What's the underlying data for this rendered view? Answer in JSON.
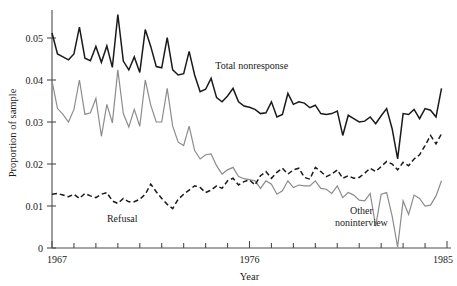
{
  "chart_data": {
    "type": "line",
    "title": "",
    "xlabel": "Year",
    "ylabel": "Proportion of sample",
    "xlim": [
      1967,
      1985
    ],
    "ylim": [
      0,
      0.055
    ],
    "grid": false,
    "legend_position": "inline-annotations",
    "y_ticks": [
      "0",
      "0.01",
      "0.02",
      "0.03",
      "0.04",
      "0.05"
    ],
    "y_tick_values": [
      0,
      0.01,
      0.02,
      0.03,
      0.04,
      0.05
    ],
    "x_ticks": [
      "1967",
      "1976",
      "1985"
    ],
    "x_tick_values": [
      1967,
      1976,
      1985
    ],
    "x_minor_tick_interval": 1,
    "colors": {
      "total_nonresponse": "#1a1a1a",
      "refusal": "#1a1a1a",
      "other_noninterview": "#8c8c8c",
      "axis": "#4d4d4d"
    },
    "series": [
      {
        "name": "Total nonresponse",
        "label": "Total nonresponse",
        "style": "solid",
        "color": "#1a1a1a",
        "width": 1.5,
        "label_x": 1976.1,
        "label_y": 0.0427,
        "x": [
          1967.0,
          1967.25,
          1967.5,
          1967.75,
          1968.0,
          1968.25,
          1968.5,
          1968.75,
          1969.0,
          1969.25,
          1969.5,
          1969.75,
          1970.0,
          1970.25,
          1970.5,
          1970.75,
          1971.0,
          1971.25,
          1971.5,
          1971.75,
          1972.0,
          1972.25,
          1972.5,
          1972.75,
          1973.0,
          1973.25,
          1973.5,
          1973.75,
          1974.0,
          1974.25,
          1974.5,
          1974.75,
          1975.0,
          1975.25,
          1975.5,
          1975.75,
          1976.0,
          1976.25,
          1976.5,
          1976.75,
          1977.0,
          1977.25,
          1977.5,
          1977.75,
          1978.0,
          1978.25,
          1978.5,
          1978.75,
          1979.0,
          1979.25,
          1979.5,
          1979.75,
          1980.0,
          1980.25,
          1980.5,
          1980.75,
          1981.0,
          1981.25,
          1981.5,
          1981.75,
          1982.0,
          1982.25,
          1982.5,
          1982.75,
          1983.0,
          1983.25,
          1983.5,
          1983.75,
          1984.0,
          1984.25,
          1984.5,
          1984.75
        ],
        "y": [
          0.0512,
          0.0462,
          0.0455,
          0.0448,
          0.0462,
          0.0526,
          0.0452,
          0.0446,
          0.048,
          0.0442,
          0.0481,
          0.043,
          0.0556,
          0.0445,
          0.0424,
          0.0455,
          0.0418,
          0.052,
          0.048,
          0.0432,
          0.0429,
          0.0501,
          0.0424,
          0.0412,
          0.0415,
          0.0468,
          0.0412,
          0.0372,
          0.0378,
          0.0404,
          0.0358,
          0.0348,
          0.0362,
          0.038,
          0.0348,
          0.0338,
          0.0335,
          0.033,
          0.032,
          0.0322,
          0.0348,
          0.0312,
          0.0318,
          0.0368,
          0.0342,
          0.0348,
          0.0345,
          0.0334,
          0.034,
          0.032,
          0.0318,
          0.032,
          0.0326,
          0.0268,
          0.0316,
          0.0308,
          0.03,
          0.0302,
          0.0312,
          0.0296,
          0.0315,
          0.0332,
          0.0284,
          0.0212,
          0.032,
          0.0318,
          0.033,
          0.0308,
          0.0332,
          0.0328,
          0.0312,
          0.038
        ]
      },
      {
        "name": "Other noninterview",
        "label": "Other\nnoninterview",
        "label_line1": "Other",
        "label_line2": "noninterview",
        "style": "solid",
        "color": "#8c8c8c",
        "width": 1.2,
        "label_x": 1981.1,
        "label_y": 0.0082,
        "x": [
          1967.0,
          1967.25,
          1967.5,
          1967.75,
          1968.0,
          1968.25,
          1968.5,
          1968.75,
          1969.0,
          1969.25,
          1969.5,
          1969.75,
          1970.0,
          1970.25,
          1970.5,
          1970.75,
          1971.0,
          1971.25,
          1971.5,
          1971.75,
          1972.0,
          1972.25,
          1972.5,
          1972.75,
          1973.0,
          1973.25,
          1973.5,
          1973.75,
          1974.0,
          1974.25,
          1974.5,
          1974.75,
          1975.0,
          1975.25,
          1975.5,
          1975.75,
          1976.0,
          1976.25,
          1976.5,
          1976.75,
          1977.0,
          1977.25,
          1977.5,
          1977.75,
          1978.0,
          1978.25,
          1978.5,
          1978.75,
          1979.0,
          1979.25,
          1979.5,
          1979.75,
          1980.0,
          1980.25,
          1980.5,
          1980.75,
          1981.0,
          1981.25,
          1981.5,
          1981.75,
          1982.0,
          1982.25,
          1982.5,
          1982.75,
          1983.0,
          1983.25,
          1983.5,
          1983.75,
          1984.0,
          1984.25,
          1984.5,
          1984.75
        ],
        "y": [
          0.0398,
          0.0332,
          0.0318,
          0.03,
          0.033,
          0.04,
          0.0318,
          0.0322,
          0.0356,
          0.0266,
          0.0342,
          0.0298,
          0.0424,
          0.032,
          0.0288,
          0.033,
          0.029,
          0.04,
          0.034,
          0.03,
          0.03,
          0.038,
          0.029,
          0.0252,
          0.0244,
          0.029,
          0.0232,
          0.0212,
          0.0222,
          0.0224,
          0.0196,
          0.0176,
          0.0186,
          0.0192,
          0.017,
          0.0165,
          0.0163,
          0.016,
          0.0142,
          0.016,
          0.0152,
          0.0128,
          0.0136,
          0.016,
          0.0144,
          0.015,
          0.0148,
          0.0148,
          0.016,
          0.0142,
          0.014,
          0.013,
          0.0148,
          0.012,
          0.0132,
          0.0126,
          0.0114,
          0.0112,
          0.013,
          0.0052,
          0.0128,
          0.0132,
          0.0076,
          0.0002,
          0.0112,
          0.008,
          0.0126,
          0.0118,
          0.01,
          0.0102,
          0.0124,
          0.016
        ]
      },
      {
        "name": "Refusal",
        "label": "Refusal",
        "style": "dashed",
        "color": "#1a1a1a",
        "width": 1.5,
        "dash": "5,3",
        "label_x": 1970.2,
        "label_y": 0.0062,
        "x": [
          1967.0,
          1967.25,
          1967.5,
          1967.75,
          1968.0,
          1968.25,
          1968.5,
          1968.75,
          1969.0,
          1969.25,
          1969.5,
          1969.75,
          1970.0,
          1970.25,
          1970.5,
          1970.75,
          1971.0,
          1971.25,
          1971.5,
          1971.75,
          1972.0,
          1972.25,
          1972.5,
          1972.75,
          1973.0,
          1973.25,
          1973.5,
          1973.75,
          1974.0,
          1974.25,
          1974.5,
          1974.75,
          1975.0,
          1975.25,
          1975.5,
          1975.75,
          1976.0,
          1976.25,
          1976.5,
          1976.75,
          1977.0,
          1977.25,
          1977.5,
          1977.75,
          1978.0,
          1978.25,
          1978.5,
          1978.75,
          1979.0,
          1979.25,
          1979.5,
          1979.75,
          1980.0,
          1980.25,
          1980.5,
          1980.75,
          1981.0,
          1981.25,
          1981.5,
          1981.75,
          1982.0,
          1982.25,
          1982.5,
          1982.75,
          1983.0,
          1983.25,
          1983.5,
          1983.75,
          1984.0,
          1984.25,
          1984.5,
          1984.75
        ],
        "y": [
          0.0128,
          0.013,
          0.0126,
          0.0122,
          0.0128,
          0.0118,
          0.013,
          0.0124,
          0.012,
          0.0128,
          0.0132,
          0.0112,
          0.0106,
          0.0118,
          0.011,
          0.011,
          0.0116,
          0.0128,
          0.0152,
          0.0134,
          0.0118,
          0.0104,
          0.0094,
          0.0116,
          0.0128,
          0.0138,
          0.0148,
          0.0144,
          0.0132,
          0.0138,
          0.0148,
          0.0142,
          0.016,
          0.0166,
          0.015,
          0.0158,
          0.0162,
          0.015,
          0.0172,
          0.0182,
          0.0166,
          0.018,
          0.019,
          0.0176,
          0.0186,
          0.019,
          0.0168,
          0.0164,
          0.0192,
          0.0182,
          0.017,
          0.0176,
          0.0186,
          0.0166,
          0.0172,
          0.0166,
          0.0168,
          0.0178,
          0.019,
          0.0182,
          0.0194,
          0.0206,
          0.02,
          0.0186,
          0.0204,
          0.0196,
          0.0212,
          0.0222,
          0.0244,
          0.0268,
          0.0248,
          0.0272
        ]
      }
    ]
  }
}
